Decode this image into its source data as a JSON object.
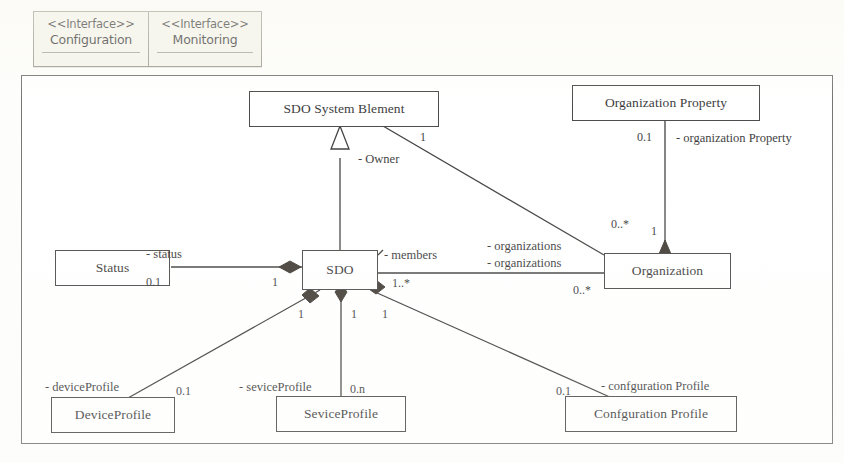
{
  "diagram": {
    "type": "uml-class-diagram",
    "interfaces": [
      {
        "stereotype": "<<Interface>>",
        "name": "Configuration"
      },
      {
        "stereotype": "<<Interface>>",
        "name": "Monitoring"
      }
    ],
    "classes": [
      {
        "id": "sdo_system_element",
        "name": "SDO System Blement"
      },
      {
        "id": "organization_property",
        "name": "Organization Property"
      },
      {
        "id": "status",
        "name": "Status"
      },
      {
        "id": "sdo",
        "name": "SDO"
      },
      {
        "id": "organization",
        "name": "Organization"
      },
      {
        "id": "device_profile",
        "name": "DeviceProfile"
      },
      {
        "id": "sevice_profile",
        "name": "SeviceProfile"
      },
      {
        "id": "confguration_profile",
        "name": "Confguration Profile"
      }
    ],
    "role_labels": [
      {
        "id": "owner",
        "text": "- Owner"
      },
      {
        "id": "organization_property_role",
        "text": "- organization Property"
      },
      {
        "id": "status_role",
        "text": "- status"
      },
      {
        "id": "members",
        "text": "- members"
      },
      {
        "id": "organizations_upper",
        "text": "- organizations"
      },
      {
        "id": "organizations_lower",
        "text": "- organizations"
      },
      {
        "id": "device_profile_role",
        "text": "- deviceProfile"
      },
      {
        "id": "sevice_profile_role",
        "text": "- seviceProfile"
      },
      {
        "id": "confguration_profile_role",
        "text": "- confguration Profile"
      }
    ],
    "multiplicities": [
      {
        "id": "m_owner_one",
        "text": "1"
      },
      {
        "id": "m_org_prop",
        "text": "0.1"
      },
      {
        "id": "m_org_upper",
        "text": "0..*"
      },
      {
        "id": "m_org_diamond",
        "text": "1"
      },
      {
        "id": "m_status_left",
        "text": "0.1"
      },
      {
        "id": "m_status_right",
        "text": "1"
      },
      {
        "id": "m_members",
        "text": "1..*"
      },
      {
        "id": "m_org_lower",
        "text": "0..*"
      },
      {
        "id": "m_device_sdo",
        "text": "1"
      },
      {
        "id": "m_sevice_sdo",
        "text": "1"
      },
      {
        "id": "m_confg_sdo",
        "text": "1"
      },
      {
        "id": "m_device_profile",
        "text": "0.1"
      },
      {
        "id": "m_sevice_profile",
        "text": "0.n"
      },
      {
        "id": "m_confg_profile",
        "text": "0.1"
      }
    ],
    "colors": {
      "ink": "#151515",
      "frame": "#5c5c58",
      "interface_fill": "#f4f3e9",
      "page": "#fdfdfb"
    }
  }
}
